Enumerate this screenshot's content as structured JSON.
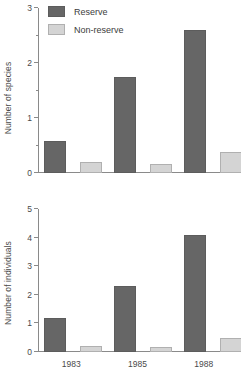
{
  "legend": {
    "items": [
      {
        "label": "Reserve",
        "color": "#666666",
        "key": "reserve"
      },
      {
        "label": "Non-reserve",
        "color": "#d4d4d4",
        "key": "nonreserve"
      }
    ]
  },
  "colors": {
    "reserve": "#666666",
    "nonreserve": "#d4d4d4",
    "axis": "#8a8a8a",
    "text": "#4a4a4a",
    "background": "#ffffff"
  },
  "chart_data": [
    {
      "type": "bar",
      "id": "species",
      "title": "",
      "xlabel": "",
      "ylabel": "Number of species",
      "categories": [
        "1983",
        "1985",
        "1988"
      ],
      "series": [
        {
          "name": "Reserve",
          "values": [
            0.58,
            1.75,
            2.6
          ],
          "color": "#666666"
        },
        {
          "name": "Non-reserve",
          "values": [
            0.2,
            0.17,
            0.38
          ],
          "color": "#d4d4d4"
        }
      ],
      "ylim": [
        0,
        3
      ],
      "yticks": [
        0,
        1,
        2,
        3
      ],
      "yticklabels": [
        "0",
        "1",
        "2",
        "3"
      ],
      "yminorticks": [
        0.5,
        1.5,
        2.5
      ],
      "grid": false,
      "legend_position": "top-left",
      "xticklabels_visible": false
    },
    {
      "type": "bar",
      "id": "individuals",
      "title": "",
      "xlabel": "",
      "ylabel": "Number of individuals",
      "categories": [
        "1983",
        "1985",
        "1988"
      ],
      "series": [
        {
          "name": "Reserve",
          "values": [
            1.2,
            2.3,
            4.1
          ],
          "color": "#666666"
        },
        {
          "name": "Non-reserve",
          "values": [
            0.22,
            0.18,
            0.5
          ],
          "color": "#d4d4d4"
        }
      ],
      "ylim": [
        0,
        5
      ],
      "yticks": [
        0,
        1,
        2,
        3,
        4,
        5
      ],
      "yticklabels": [
        "0",
        "1",
        "2",
        "3",
        "4",
        "5"
      ],
      "yminorticks": [],
      "grid": false,
      "legend_position": "none",
      "xticklabels_visible": true
    }
  ],
  "caption": ""
}
